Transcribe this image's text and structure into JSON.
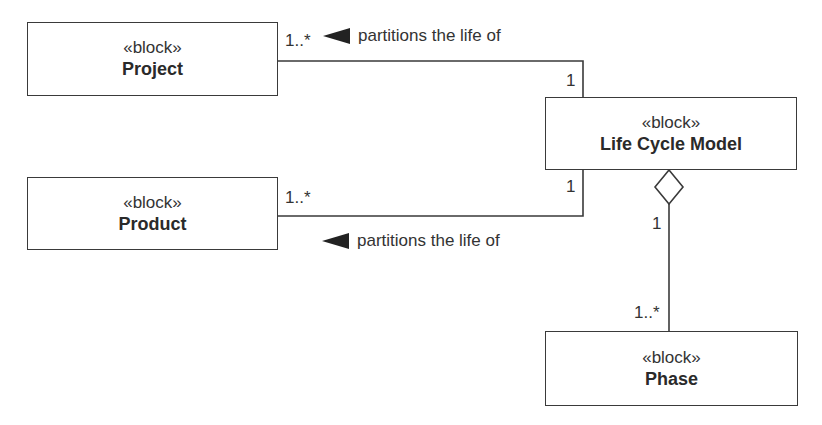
{
  "blocks": {
    "project": {
      "stereotype": "«block»",
      "name": "Project"
    },
    "product": {
      "stereotype": "«block»",
      "name": "Product"
    },
    "life_cycle_model": {
      "stereotype": "«block»",
      "name": "Life Cycle Model"
    },
    "phase": {
      "stereotype": "«block»",
      "name": "Phase"
    }
  },
  "associations": [
    {
      "from": "Project",
      "to": "Life Cycle Model",
      "label": "partitions the life of",
      "from_multiplicity": "1..*",
      "to_multiplicity": "1",
      "direction_arrow": "left"
    },
    {
      "from": "Product",
      "to": "Life Cycle Model",
      "label": "partitions the life of",
      "from_multiplicity": "1..*",
      "to_multiplicity": "1",
      "direction_arrow": "left"
    },
    {
      "from": "Life Cycle Model",
      "to": "Phase",
      "kind": "aggregation",
      "from_multiplicity": "1",
      "to_multiplicity": "1..*"
    }
  ]
}
